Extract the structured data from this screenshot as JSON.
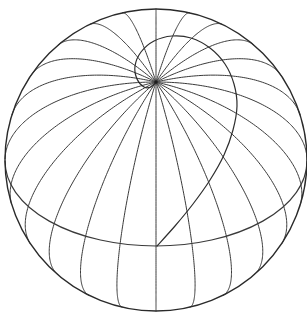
{
  "figure": {
    "stroke_color": "#3a3a3a",
    "background": "#ffffff",
    "sphere": {
      "cx": 156,
      "cy": 160,
      "r": 151
    },
    "pole": {
      "x": 156,
      "y": 82
    },
    "meridian_count": 24,
    "equator": {
      "cx": 156,
      "cy": 161,
      "rx": 151,
      "ry": 85
    },
    "spiral_points": [
      [
        157,
        246
      ],
      [
        175,
        226
      ],
      [
        193,
        204
      ],
      [
        210,
        180
      ],
      [
        224,
        155
      ],
      [
        233,
        130
      ],
      [
        237,
        106
      ],
      [
        234,
        84
      ],
      [
        225,
        64
      ],
      [
        210,
        48
      ],
      [
        191,
        38
      ],
      [
        172,
        36
      ],
      [
        154,
        41
      ],
      [
        141,
        52
      ],
      [
        135,
        66
      ],
      [
        137,
        79
      ],
      [
        144,
        87
      ],
      [
        151,
        87
      ],
      [
        156,
        82
      ]
    ]
  }
}
